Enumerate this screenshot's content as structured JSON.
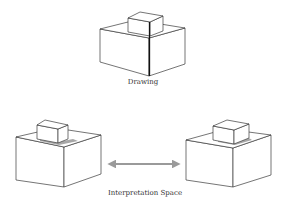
{
  "figure": {
    "top_panel": {
      "caption": "Drawing",
      "description": "line drawing of a small box on top of a larger box"
    },
    "bottom_panel": {
      "caption": "Interpretation Space",
      "left_interpretation": "small box resting on larger box (shadow behind front)",
      "right_interpretation": "small box resting on larger box (shadow near right)",
      "connector": "double-headed-arrow"
    },
    "colors": {
      "line": "#3a3a3a",
      "arrow": "#9a9a9a",
      "shadow": "#8a8a8a",
      "background": "#ffffff"
    }
  }
}
